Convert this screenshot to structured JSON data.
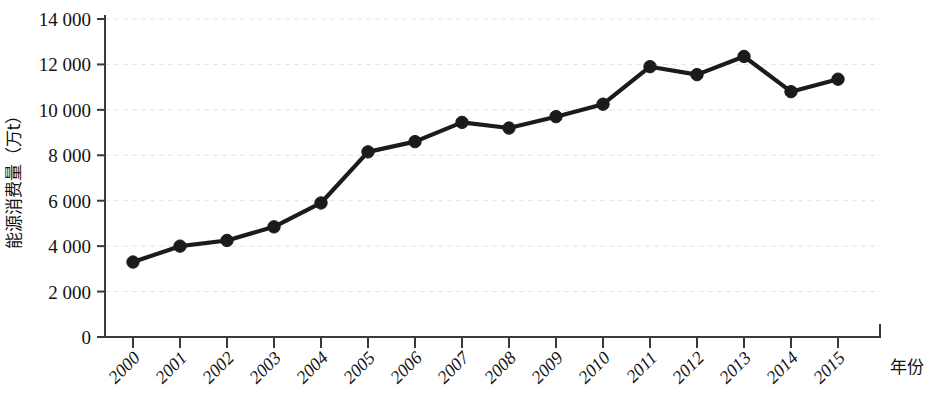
{
  "chart_data": {
    "type": "line",
    "title": "",
    "subtitle": "",
    "xlabel": "年份",
    "ylabel": "能源消费量（万t）",
    "categories": [
      "2000",
      "2001",
      "2002",
      "2003",
      "2004",
      "2005",
      "2006",
      "2007",
      "2008",
      "2009",
      "2010",
      "2011",
      "2012",
      "2013",
      "2014",
      "2015"
    ],
    "x": [
      2000,
      2001,
      2002,
      2003,
      2004,
      2005,
      2006,
      2007,
      2008,
      2009,
      2010,
      2011,
      2012,
      2013,
      2014,
      2015
    ],
    "values": [
      3300,
      4000,
      4250,
      4850,
      5900,
      8150,
      8600,
      9450,
      9200,
      9700,
      10250,
      11900,
      11550,
      12350,
      10800,
      11350
    ],
    "series": [
      {
        "name": "能源消费量",
        "values": [
          3300,
          4000,
          4250,
          4850,
          5900,
          8150,
          8600,
          9450,
          9200,
          9700,
          10250,
          11900,
          11550,
          12350,
          10800,
          11350
        ]
      }
    ],
    "ylim": [
      0,
      14000
    ],
    "ytick_values": [
      0,
      2000,
      4000,
      6000,
      8000,
      10000,
      12000,
      14000
    ],
    "ytick_labels": [
      "0",
      "2 000",
      "4 000",
      "6 000",
      "8 000",
      "10 000",
      "12 000",
      "14 000"
    ],
    "xtick_labels": [
      "2000",
      "2001",
      "2002",
      "2003",
      "2004",
      "2005",
      "2006",
      "2007",
      "2008",
      "2009",
      "2010",
      "2011",
      "2012",
      "2013",
      "2014",
      "2015"
    ],
    "grid": true,
    "grid_axis": "y",
    "legend": false,
    "legend_position": "none",
    "marker": "circle",
    "line_color": "#1b1b1b",
    "marker_color": "#1b1b1b",
    "grid_color": "#e8e3e3",
    "axis_color": "#3a3a3a",
    "background_color": "#ffffff",
    "xtick_rotation": 45
  }
}
